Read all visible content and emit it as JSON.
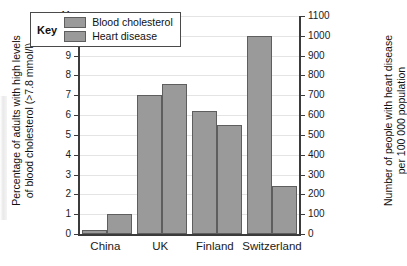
{
  "chart_data": {
    "type": "bar",
    "title": "",
    "categories": [
      "China",
      "UK",
      "Finland",
      "Switzerland"
    ],
    "series": [
      {
        "name": "Blood cholesterol",
        "axis": "left",
        "units": "% of adults",
        "values": [
          0.2,
          7.0,
          6.2,
          10.0
        ]
      },
      {
        "name": "Heart disease",
        "axis": "right",
        "units": "per 100 000 population",
        "values_left_scale": [
          1.0,
          7.55,
          5.5,
          2.4
        ],
        "values": [
          100,
          755,
          550,
          240
        ]
      }
    ],
    "xlabel": "",
    "ylabel_left": "Percentage of adults with high levels of blood cholesterol (>7.8 mmol/l)",
    "ylabel_right": "Number of people with heart disease per 100 000 population",
    "ylim_left": [
      0,
      11
    ],
    "ylim_right": [
      0,
      1100
    ],
    "yticks_left": [
      0,
      1,
      2,
      3,
      4,
      5,
      6,
      7,
      8,
      9,
      10,
      11
    ],
    "yticks_right": [
      0,
      100,
      200,
      300,
      400,
      500,
      600,
      700,
      800,
      900,
      1000,
      1100
    ],
    "grid": true,
    "legend_position": "top-left-inside",
    "bar_color": "#9a9a9a",
    "bar_edge_color": "#5e5e5e",
    "axis_color": "#3b3b3b",
    "grid_color": "#e4e4e4"
  },
  "axis_titles": {
    "left_line1": "Percentage of adults with high levels",
    "left_line2": "of blood cholesterol (>7.8 mmol/l)",
    "right_line1": "Number of people with heart disease",
    "right_line2": "per 100 000 population"
  },
  "legend": {
    "title": "Key",
    "items": [
      {
        "label": "Blood cholesterol"
      },
      {
        "label": "Heart disease"
      }
    ]
  }
}
